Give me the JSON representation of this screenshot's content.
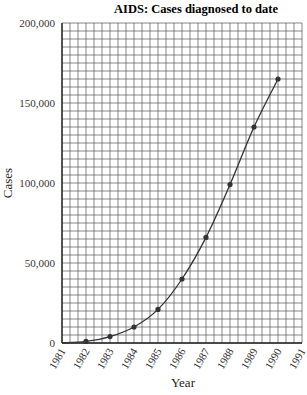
{
  "chart_data": {
    "type": "line",
    "title": "AIDS: Cases diagnosed to date",
    "xlabel": "Year",
    "ylabel": "Cases",
    "x_ticks": [
      "1981",
      "1982",
      "1983",
      "1984",
      "1985",
      "1986",
      "1987",
      "1988",
      "1989",
      "1990",
      "1991"
    ],
    "y_ticks": [
      "0",
      "50,000",
      "100,000",
      "150,000",
      "200,000"
    ],
    "xlim": [
      1981,
      1991
    ],
    "ylim": [
      0,
      200000
    ],
    "grid": true,
    "legend": null,
    "series": [
      {
        "name": "Cases diagnosed to date",
        "x": [
          1982,
          1983,
          1984,
          1985,
          1986,
          1987,
          1988,
          1989,
          1990
        ],
        "values": [
          1000,
          4000,
          10000,
          21000,
          40000,
          66000,
          99000,
          135000,
          165000
        ]
      }
    ]
  },
  "colors": {
    "grid": "#555555",
    "line": "#333333",
    "marker": "#333333",
    "text": "#222222"
  }
}
